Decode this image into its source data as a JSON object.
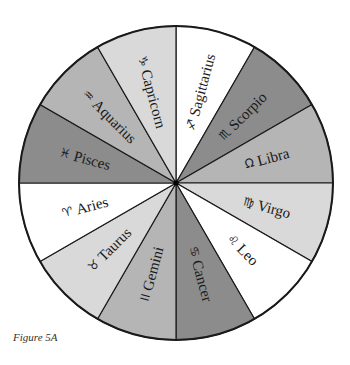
{
  "figure": {
    "caption": "Figure 5A",
    "center": [
      176,
      183
    ],
    "radius": 157,
    "colors": {
      "white": "#ffffff",
      "light": "#d9d9d9",
      "medium": "#b5b5b5",
      "dark": "#8c8c8c",
      "stroke": "#1a1a1a"
    },
    "signs": [
      {
        "name": "Sagittarius",
        "glyph": "♐",
        "shade": "white"
      },
      {
        "name": "Scorpio",
        "glyph": "♏",
        "shade": "dark"
      },
      {
        "name": "Libra",
        "glyph": "Ω",
        "shade": "medium"
      },
      {
        "name": "Virgo",
        "glyph": "♍",
        "shade": "light"
      },
      {
        "name": "Leo",
        "glyph": "♌",
        "shade": "white"
      },
      {
        "name": "Cancer",
        "glyph": "♋",
        "shade": "dark"
      },
      {
        "name": "Gemini",
        "glyph": "II",
        "shade": "medium"
      },
      {
        "name": "Taurus",
        "glyph": "♉",
        "shade": "light"
      },
      {
        "name": "Aries",
        "glyph": "♈",
        "shade": "white"
      },
      {
        "name": "Pisces",
        "glyph": "♓",
        "shade": "dark"
      },
      {
        "name": "Aquarius",
        "glyph": "♒",
        "shade": "medium"
      },
      {
        "name": "Capricorn",
        "glyph": "♑",
        "shade": "light"
      }
    ]
  }
}
